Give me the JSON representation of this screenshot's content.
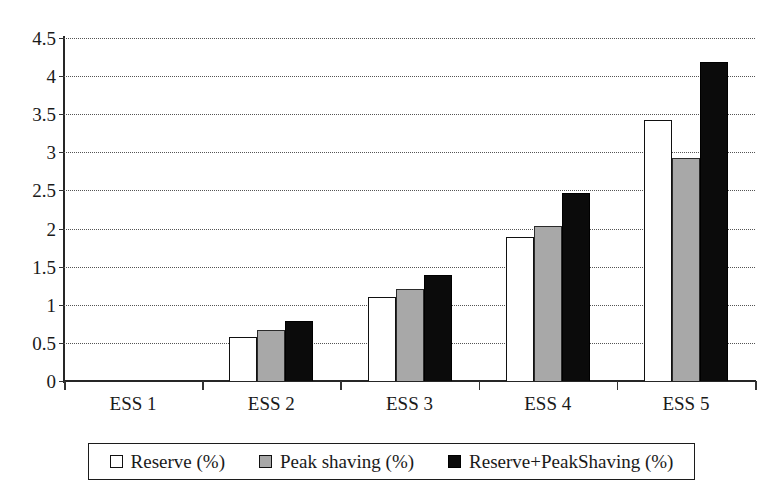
{
  "chart_data": {
    "type": "bar",
    "title": "",
    "subtitle": "",
    "xlabel": "",
    "ylabel": "",
    "categories": [
      "ESS 1",
      "ESS 2",
      "ESS 3",
      "ESS 4",
      "ESS 5"
    ],
    "series": [
      {
        "name": "Reserve (%)",
        "values": [
          0,
          0.58,
          1.1,
          1.89,
          3.42
        ],
        "color": "#ffffff"
      },
      {
        "name": "Peak shaving (%)",
        "values": [
          0,
          0.67,
          1.21,
          2.04,
          2.93
        ],
        "color": "#a8a8a8"
      },
      {
        "name": "Reserve+PeakShaving (%)",
        "values": [
          0,
          0.79,
          1.39,
          2.47,
          4.18
        ],
        "color": "#0b0b0b"
      }
    ],
    "ylim": [
      0,
      4.5
    ],
    "ytick_values": [
      0,
      0.5,
      1,
      1.5,
      2,
      2.5,
      3,
      3.5,
      4,
      4.5
    ],
    "ytick_labels": [
      "0",
      "0.5",
      "1",
      "1.5",
      "2",
      "2.5",
      "3",
      "3.5",
      "4",
      "4.5"
    ],
    "grid": true,
    "grid_style": "dotted",
    "grid_axis": "y",
    "legend_position": "bottom",
    "legend_border": true
  },
  "legend": {
    "items": [
      {
        "label": "Reserve (%)",
        "swatch": "white"
      },
      {
        "label": "Peak shaving (%)",
        "swatch": "gray"
      },
      {
        "label": "Reserve+PeakShaving (%)",
        "swatch": "black"
      }
    ]
  },
  "colors": {
    "axis": "#262626",
    "grid": "#555555",
    "text": "#1a1a1a",
    "series_reserve": "#ffffff",
    "series_peak_shaving": "#a8a8a8",
    "series_reserve_peak": "#0b0b0b",
    "background": "#ffffff"
  }
}
